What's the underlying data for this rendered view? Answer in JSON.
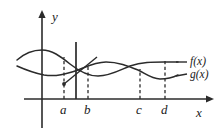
{
  "figure": {
    "kind": "cartesian-graph",
    "background_color": "#ffffff",
    "ink_color": "#2b2b2b",
    "width": 221,
    "height": 135
  },
  "axes": {
    "x_axis": {
      "label": "x",
      "label_position": {
        "x": 196,
        "y": 108
      },
      "origin": {
        "x": 42,
        "y": 99
      },
      "end": {
        "x": 209,
        "y": 99
      },
      "arrow": "right"
    },
    "y_axis": {
      "label": "y",
      "label_position": {
        "x": 52,
        "y": 10
      },
      "bottom": {
        "x": 42,
        "y": 128
      },
      "top": {
        "x": 42,
        "y": 13
      },
      "arrow": "up"
    }
  },
  "tick_marks": [
    {
      "name": "a",
      "label": "a",
      "x": 64,
      "label_x": 60,
      "label_y": 103,
      "drop_top_y": 57,
      "dashed": true
    },
    {
      "name": "b",
      "label": "b",
      "x": 88,
      "label_x": 84,
      "label_y": 103,
      "drop_top_y": 65,
      "dashed": true
    },
    {
      "name": "c",
      "label": "c",
      "x": 140,
      "label_x": 136,
      "label_y": 103,
      "drop_top_y": 70,
      "dashed": true
    },
    {
      "name": "d",
      "label": "d",
      "x": 165,
      "label_x": 161,
      "label_y": 103,
      "drop_top_y": 62,
      "dashed": true
    }
  ],
  "vertical_line": {
    "name": "solid-vertical-line",
    "x": 76,
    "top_y": 42,
    "bottom_y": 99
  },
  "curves": [
    {
      "name": "f",
      "label": "f(x)",
      "label_position": {
        "x": 190,
        "y": 57
      },
      "lead_line": {
        "x1": 176,
        "y1": 62,
        "x2": 188,
        "y2": 62
      },
      "path": "M 17,60 C 26,52 34,50 42,50 C 52,50 60,56 70,64 C 80,72 88,76 98,76 C 110,76 120,70 130,66 C 142,62 152,62 164,62 C 170,62 174,62 178,62"
    },
    {
      "name": "g",
      "label": "g(x)",
      "label_position": {
        "x": 190,
        "y": 71
      },
      "lead_line": {
        "x1": 176,
        "y1": 76,
        "x2": 188,
        "y2": 76
      },
      "path": "M 17,66 C 26,70 34,73 44,75 C 56,77 66,74 78,70 C 88,66 96,62 106,62 C 118,62 128,66 138,70 C 146,74 152,79 160,79 C 168,79 174,77 178,75"
    }
  ],
  "secant": {
    "name": "secant-segment",
    "x1": 64,
    "y1": 84,
    "x2": 96,
    "y2": 58,
    "dot": {
      "x": 64,
      "y": 84,
      "r": 1.9
    }
  },
  "curve_data": {
    "type": "line",
    "title": "",
    "xlabel": "x",
    "ylabel": "y",
    "series": [
      {
        "name": "f(x)",
        "note": "upper wave: peak near y-axis, trough near b, rises to the right"
      },
      {
        "name": "g(x)",
        "note": "lower wave: rises to peak between b and c, dips near d"
      }
    ],
    "marked_x_values": [
      "a",
      "b",
      "c",
      "d"
    ],
    "intersections": [
      "b",
      "c"
    ],
    "legend": [
      "f(x)",
      "g(x)"
    ],
    "grid": false
  }
}
